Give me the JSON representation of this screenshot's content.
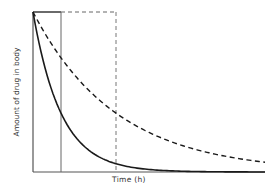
{
  "chart_data": {
    "type": "line",
    "title": "",
    "xlabel": "Time (h)",
    "ylabel": "Amount of drug in body",
    "grid": false,
    "legend": null,
    "axis_ticks": false,
    "x_range_px": [
      33,
      265
    ],
    "y_range_px": [
      172,
      12
    ],
    "initial_amount": 1.0,
    "series": [
      {
        "name": "fast elimination",
        "style": "solid",
        "model": "exponential decay",
        "time_constant_fraction_of_axis": 0.12,
        "values_at_markers": {
          "t1": 0.37,
          "t2": 0.05
        },
        "end_value": 0.0
      },
      {
        "name": "slow elimination",
        "style": "dashed",
        "model": "exponential decay",
        "time_constant_fraction_of_axis": 0.36,
        "values_at_markers": {
          "t1": 0.71,
          "t2": 0.37
        },
        "end_value": 0.06
      }
    ],
    "markers": [
      {
        "name": "t1",
        "style": "solid",
        "x_fraction": 0.12,
        "description": "vertical line bounding rectangle of initial amount (solid)"
      },
      {
        "name": "t2",
        "style": "dashed",
        "x_fraction": 0.36,
        "description": "vertical line bounding rectangle of initial amount (dashed)"
      }
    ]
  },
  "labels": {
    "x_axis": "Time (h)",
    "y_axis": "Amount of drug in body"
  },
  "geometry": {
    "x0": 33,
    "y0": 172,
    "xEnd": 265,
    "yTop": 12,
    "tau_solid_px": 28,
    "tau_dashed_px": 83
  },
  "colors": {
    "axis": "#555555",
    "curve": "#1a1a1a",
    "marker": "#666666"
  }
}
